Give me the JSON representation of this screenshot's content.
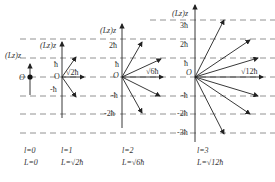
{
  "axis_label": "(Lz)z",
  "origin_label": "O",
  "panels": [
    {
      "l_label": "l=0",
      "L_label": "L=0",
      "ticks": [],
      "magnitude_label": ""
    },
    {
      "l_label": "l=1",
      "L_label": "L=√2ħ",
      "ticks": [
        "ħ",
        "-ħ"
      ],
      "magnitude_label": "√2ħ"
    },
    {
      "l_label": "l=2",
      "L_label": "L=√6ħ",
      "ticks": [
        "2ħ",
        "ħ",
        "-ħ",
        "-2ħ"
      ],
      "magnitude_label": "√6ħ"
    },
    {
      "l_label": "l=3",
      "L_label": "L=√12ħ",
      "ticks": [
        "3ħ",
        "2ħ",
        "ħ",
        "-ħ",
        "-2ħ",
        "-3ħ"
      ],
      "magnitude_label": "√12ħ"
    }
  ],
  "colors": {
    "line": "#333333",
    "dash": "#666666",
    "background": "#ffffff"
  }
}
